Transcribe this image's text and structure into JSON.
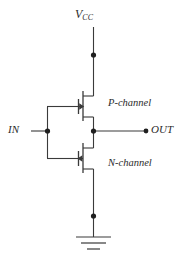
{
  "diagram": {
    "type": "circuit-schematic",
    "stroke_color": "#3a3a3a",
    "text_color": "#2b2b2b",
    "background": "#ffffff"
  },
  "labels": {
    "supply": "V",
    "supply_subscript": "CC",
    "input": "IN",
    "output": "OUT",
    "pmos": "P-channel",
    "nmos": "N-channel"
  },
  "nodes": [
    {
      "name": "vcc-junction",
      "x": 93,
      "y": 55
    },
    {
      "name": "input-junction",
      "x": 47,
      "y": 131
    },
    {
      "name": "output-junction",
      "x": 94,
      "y": 131
    },
    {
      "name": "ground-junction",
      "x": 94,
      "y": 216
    },
    {
      "name": "output-terminal",
      "x": 145,
      "y": 131
    }
  ],
  "components": [
    {
      "name": "pmos-transistor",
      "type": "P-channel MOSFET",
      "label": "P-channel",
      "arrow_direction": "right"
    },
    {
      "name": "nmos-transistor",
      "type": "N-channel MOSFET",
      "label": "N-channel",
      "arrow_direction": "left"
    },
    {
      "name": "ground-symbol",
      "type": "ground",
      "bars": 3
    }
  ]
}
